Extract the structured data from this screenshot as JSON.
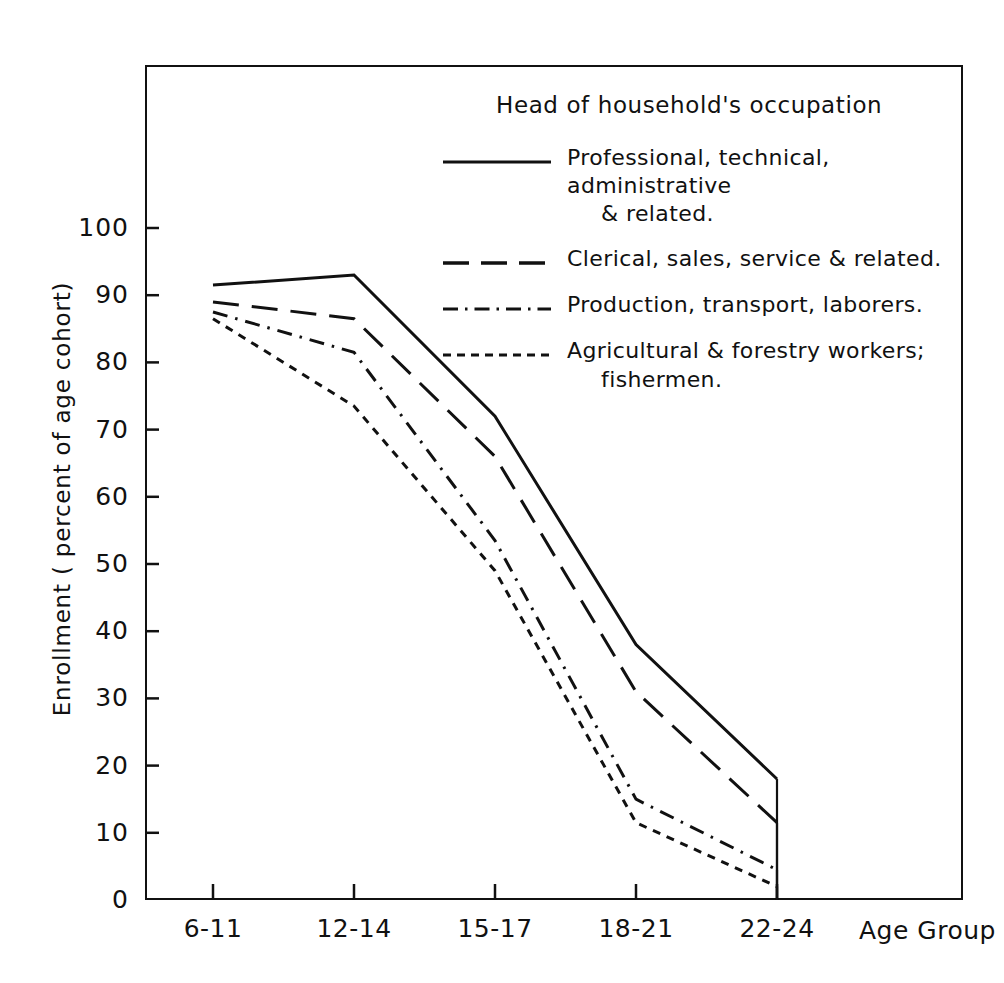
{
  "chart_data": {
    "type": "line",
    "title": "",
    "xlabel": "Age Group",
    "ylabel": "Enrollment ( percent of age cohort)",
    "categories": [
      "6-11",
      "12-14",
      "15-17",
      "18-21",
      "22-24"
    ],
    "ylim": [
      0,
      100
    ],
    "yticks": [
      0,
      10,
      20,
      30,
      40,
      50,
      60,
      70,
      80,
      90,
      100
    ],
    "ytick_labels": [
      "0",
      "10",
      "20",
      "30",
      "40",
      "50",
      "60",
      "70",
      "80",
      "90",
      "100"
    ],
    "grid": false,
    "legend_position": "inside-top-right",
    "legend_title": "Head of household's occupation",
    "series": [
      {
        "name": "Professional, technical, administrative & related.",
        "name_line1": "Professional, technical, administrative",
        "name_line2": "& related.",
        "style": "solid",
        "values": [
          91.5,
          93,
          72,
          38,
          18
        ]
      },
      {
        "name": "Clerical, sales, service & related.",
        "name_line1": "Clerical, sales, service & related.",
        "name_line2": "",
        "style": "dashed",
        "values": [
          89,
          86.5,
          66,
          31,
          11.5
        ]
      },
      {
        "name": "Production, transport, laborers.",
        "name_line1": "Production, transport, laborers.",
        "name_line2": "",
        "style": "dashdot",
        "values": [
          87.5,
          81.5,
          53.5,
          15,
          4.5
        ]
      },
      {
        "name": "Agricultural & forestry workers; fishermen.",
        "name_line1": "Agricultural & forestry workers;",
        "name_line2": "fishermen.",
        "style": "dotted",
        "values": [
          86.5,
          73.5,
          49,
          11.5,
          2
        ]
      }
    ],
    "colors": {
      "ink": "#111111",
      "background": "#ffffff"
    }
  }
}
